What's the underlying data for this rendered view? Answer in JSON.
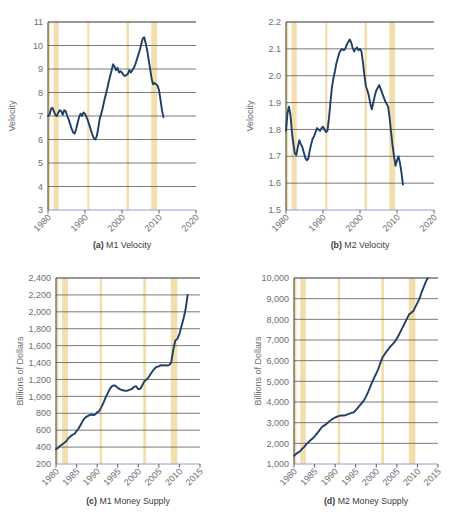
{
  "figure": {
    "background": "#ffffff",
    "series_color": "#1e3f66",
    "recession_band_color": "#f3dfae",
    "gridline_color": "#6b6b6b",
    "axis_color": "#4b4b4b",
    "baseline_color": "#9a9ad6"
  },
  "chart_data": [
    {
      "id": "a",
      "type": "line",
      "title": "M1 Velocity",
      "caption_prefix": "(a)",
      "xlabel": "",
      "ylabel": "Velocity",
      "xlim": [
        1980,
        2020
      ],
      "ylim": [
        3,
        11
      ],
      "ytick_step": 1,
      "xtick_step": 10,
      "grid": true,
      "legend": "none",
      "xticks": [
        "1980",
        "1990",
        "2000",
        "2010",
        "2020"
      ],
      "yticks": [
        "3",
        "4",
        "5",
        "6",
        "7",
        "8",
        "9",
        "10",
        "11"
      ],
      "recessions": [
        [
          1980.0,
          1980.6
        ],
        [
          1981.5,
          1982.9
        ],
        [
          1990.6,
          1991.2
        ],
        [
          2001.2,
          2001.9
        ],
        [
          2007.9,
          2009.5
        ]
      ],
      "x": [
        1980.0,
        1980.4,
        1980.8,
        1981.2,
        1981.6,
        1982.0,
        1982.4,
        1982.8,
        1983.2,
        1983.6,
        1984.0,
        1984.4,
        1984.8,
        1985.2,
        1985.6,
        1986.0,
        1986.4,
        1986.8,
        1987.2,
        1987.6,
        1988.0,
        1988.4,
        1988.8,
        1989.2,
        1989.6,
        1990.0,
        1990.4,
        1990.8,
        1991.2,
        1991.6,
        1992.0,
        1992.4,
        1992.8,
        1993.2,
        1993.6,
        1994.0,
        1994.4,
        1994.8,
        1995.2,
        1995.6,
        1996.0,
        1996.4,
        1996.8,
        1997.2,
        1997.6,
        1998.0,
        1998.4,
        1998.8,
        1999.2,
        1999.6,
        2000.0,
        2000.4,
        2000.8,
        2001.2,
        2001.6,
        2002.0,
        2002.4,
        2002.8,
        2003.2,
        2003.6,
        2004.0,
        2004.4,
        2004.8,
        2005.2,
        2005.6,
        2006.0,
        2006.4,
        2006.8,
        2007.2,
        2007.6,
        2008.0,
        2008.4,
        2008.8,
        2009.2,
        2009.6,
        2010.0,
        2010.4,
        2010.8,
        2011.2
      ],
      "y": [
        7.0,
        7.05,
        7.3,
        7.35,
        7.2,
        7.05,
        7.0,
        7.15,
        7.25,
        7.2,
        7.05,
        7.25,
        7.2,
        7.0,
        6.85,
        6.65,
        6.45,
        6.3,
        6.25,
        6.45,
        6.7,
        6.95,
        7.1,
        7.0,
        7.15,
        7.1,
        6.95,
        6.8,
        6.6,
        6.4,
        6.2,
        6.05,
        6.0,
        6.15,
        6.5,
        6.9,
        7.1,
        7.35,
        7.65,
        7.9,
        8.15,
        8.45,
        8.7,
        8.95,
        9.2,
        9.1,
        8.95,
        9.05,
        8.85,
        8.9,
        8.85,
        8.75,
        8.7,
        8.75,
        8.8,
        8.95,
        8.85,
        8.95,
        9.05,
        9.2,
        9.4,
        9.6,
        9.8,
        10.05,
        10.3,
        10.35,
        10.1,
        9.8,
        9.4,
        9.0,
        8.6,
        8.35,
        8.4,
        8.35,
        8.3,
        8.1,
        7.7,
        7.25,
        6.95
      ]
    },
    {
      "id": "b",
      "type": "line",
      "title": "M2 Velocity",
      "caption_prefix": "(b)",
      "xlabel": "",
      "ylabel": "Velocity",
      "xlim": [
        1980,
        2020
      ],
      "ylim": [
        1.5,
        2.2
      ],
      "ytick_step": 0.1,
      "xtick_step": 10,
      "grid": true,
      "legend": "none",
      "xticks": [
        "1980",
        "1990",
        "2000",
        "2010",
        "2020"
      ],
      "yticks": [
        "1.5",
        "1.6",
        "1.7",
        "1.8",
        "1.9",
        "2.0",
        "2.1",
        "2.2"
      ],
      "recessions": [
        [
          1980.0,
          1980.6
        ],
        [
          1981.5,
          1982.9
        ],
        [
          1990.6,
          1991.2
        ],
        [
          2001.2,
          2001.9
        ],
        [
          2007.9,
          2009.5
        ]
      ],
      "x": [
        1980.0,
        1980.4,
        1980.8,
        1981.2,
        1981.6,
        1982.0,
        1982.4,
        1982.8,
        1983.2,
        1983.6,
        1984.0,
        1984.4,
        1984.8,
        1985.2,
        1985.6,
        1986.0,
        1986.4,
        1986.8,
        1987.2,
        1987.6,
        1988.0,
        1988.4,
        1988.8,
        1989.2,
        1989.6,
        1990.0,
        1990.4,
        1990.8,
        1991.2,
        1991.6,
        1992.0,
        1992.4,
        1992.8,
        1993.2,
        1993.6,
        1994.0,
        1994.4,
        1994.8,
        1995.2,
        1995.6,
        1996.0,
        1996.4,
        1996.8,
        1997.2,
        1997.6,
        1998.0,
        1998.4,
        1998.8,
        1999.2,
        1999.6,
        2000.0,
        2000.4,
        2000.8,
        2001.2,
        2001.6,
        2002.0,
        2002.4,
        2002.8,
        2003.2,
        2003.6,
        2004.0,
        2004.4,
        2004.8,
        2005.2,
        2005.6,
        2006.0,
        2006.4,
        2006.8,
        2007.2,
        2007.6,
        2008.0,
        2008.4,
        2008.8,
        2009.2,
        2009.6,
        2010.0,
        2010.4,
        2010.8,
        2011.2,
        2011.6
      ],
      "y": [
        1.795,
        1.86,
        1.885,
        1.855,
        1.79,
        1.745,
        1.71,
        1.705,
        1.735,
        1.76,
        1.745,
        1.735,
        1.715,
        1.695,
        1.685,
        1.69,
        1.72,
        1.745,
        1.765,
        1.775,
        1.79,
        1.805,
        1.8,
        1.795,
        1.805,
        1.81,
        1.8,
        1.79,
        1.795,
        1.84,
        1.9,
        1.955,
        1.99,
        2.015,
        2.045,
        2.065,
        2.085,
        2.095,
        2.1,
        2.095,
        2.1,
        2.115,
        2.125,
        2.135,
        2.125,
        2.105,
        2.09,
        2.1,
        2.105,
        2.095,
        2.1,
        2.09,
        2.05,
        2.0,
        1.96,
        1.945,
        1.925,
        1.895,
        1.875,
        1.9,
        1.925,
        1.945,
        1.955,
        1.965,
        1.95,
        1.935,
        1.92,
        1.905,
        1.895,
        1.885,
        1.845,
        1.79,
        1.74,
        1.7,
        1.665,
        1.685,
        1.7,
        1.675,
        1.64,
        1.595
      ]
    },
    {
      "id": "c",
      "type": "line",
      "title": "M1 Money Supply",
      "caption_prefix": "(c)",
      "xlabel": "",
      "ylabel": "Billions of Dollars",
      "xlim": [
        1980,
        2015
      ],
      "ylim": [
        200,
        2400
      ],
      "ytick_step": 200,
      "xtick_step": 5,
      "grid": true,
      "legend": "none",
      "xticks": [
        "1980",
        "1985",
        "1990",
        "1995",
        "2000",
        "2005",
        "2010",
        "2015"
      ],
      "yticks": [
        "200",
        "400",
        "600",
        "800",
        "1,000",
        "1,200",
        "1,400",
        "1,600",
        "1,800",
        "2,000",
        "2,200",
        "2,400"
      ],
      "recessions": [
        [
          1980.0,
          1980.6
        ],
        [
          1981.5,
          1982.9
        ],
        [
          1990.6,
          1991.2
        ],
        [
          2001.2,
          2001.9
        ],
        [
          2007.9,
          2009.5
        ]
      ],
      "x": [
        1980.0,
        1980.5,
        1981.0,
        1981.5,
        1982.0,
        1982.5,
        1983.0,
        1983.5,
        1984.0,
        1984.5,
        1985.0,
        1985.5,
        1986.0,
        1986.5,
        1987.0,
        1987.5,
        1988.0,
        1988.5,
        1989.0,
        1989.5,
        1990.0,
        1990.5,
        1991.0,
        1991.5,
        1992.0,
        1992.5,
        1993.0,
        1993.5,
        1994.0,
        1994.5,
        1995.0,
        1995.5,
        1996.0,
        1996.5,
        1997.0,
        1997.5,
        1998.0,
        1998.5,
        1999.0,
        1999.5,
        2000.0,
        2000.5,
        2001.0,
        2001.5,
        2002.0,
        2002.5,
        2003.0,
        2003.5,
        2004.0,
        2004.5,
        2005.0,
        2005.5,
        2006.0,
        2006.5,
        2007.0,
        2007.5,
        2008.0,
        2008.5,
        2009.0,
        2009.5,
        2010.0,
        2010.5,
        2011.0,
        2011.5,
        2012.0
      ],
      "y": [
        375,
        390,
        415,
        430,
        450,
        470,
        505,
        525,
        545,
        555,
        590,
        620,
        665,
        710,
        745,
        760,
        775,
        785,
        780,
        785,
        810,
        825,
        870,
        920,
        980,
        1030,
        1080,
        1115,
        1130,
        1125,
        1100,
        1085,
        1075,
        1070,
        1065,
        1070,
        1080,
        1090,
        1115,
        1120,
        1085,
        1090,
        1135,
        1180,
        1200,
        1225,
        1265,
        1300,
        1330,
        1350,
        1355,
        1370,
        1365,
        1370,
        1365,
        1370,
        1400,
        1550,
        1660,
        1680,
        1740,
        1830,
        1920,
        2030,
        2200
      ]
    },
    {
      "id": "d",
      "type": "line",
      "title": "M2 Money Supply",
      "caption_prefix": "(d)",
      "xlabel": "",
      "ylabel": "Billions of Dollars",
      "xlim": [
        1980,
        2015
      ],
      "ylim": [
        1000,
        10000
      ],
      "ytick_step": 1000,
      "xtick_step": 5,
      "grid": true,
      "legend": "none",
      "xticks": [
        "1980",
        "1985",
        "1990",
        "1995",
        "2000",
        "2005",
        "2010",
        "2015"
      ],
      "yticks": [
        "1,000",
        "2,000",
        "3,000",
        "4,000",
        "5,000",
        "6,000",
        "7,000",
        "8,000",
        "9,000",
        "10,000"
      ],
      "recessions": [
        [
          1980.0,
          1980.6
        ],
        [
          1981.5,
          1982.9
        ],
        [
          1990.6,
          1991.2
        ],
        [
          2001.2,
          2001.9
        ],
        [
          2007.9,
          2009.5
        ]
      ],
      "x": [
        1980.0,
        1980.5,
        1981.0,
        1981.5,
        1982.0,
        1982.5,
        1983.0,
        1983.5,
        1984.0,
        1984.5,
        1985.0,
        1985.5,
        1986.0,
        1986.5,
        1987.0,
        1987.5,
        1988.0,
        1988.5,
        1989.0,
        1989.5,
        1990.0,
        1990.5,
        1991.0,
        1991.5,
        1992.0,
        1992.5,
        1993.0,
        1993.5,
        1994.0,
        1994.5,
        1995.0,
        1995.5,
        1996.0,
        1996.5,
        1997.0,
        1997.5,
        1998.0,
        1998.5,
        1999.0,
        1999.5,
        2000.0,
        2000.5,
        2001.0,
        2001.5,
        2002.0,
        2002.5,
        2003.0,
        2003.5,
        2004.0,
        2004.5,
        2005.0,
        2005.5,
        2006.0,
        2006.5,
        2007.0,
        2007.5,
        2008.0,
        2008.5,
        2009.0,
        2009.5,
        2010.0,
        2010.5,
        2011.0,
        2011.5,
        2012.0,
        2012.5
      ],
      "y": [
        1400,
        1480,
        1560,
        1620,
        1740,
        1830,
        1960,
        2050,
        2150,
        2230,
        2340,
        2460,
        2580,
        2720,
        2820,
        2880,
        2960,
        3050,
        3130,
        3200,
        3250,
        3290,
        3330,
        3350,
        3350,
        3360,
        3400,
        3440,
        3470,
        3500,
        3600,
        3720,
        3840,
        3960,
        4080,
        4260,
        4480,
        4720,
        4960,
        5180,
        5380,
        5600,
        5900,
        6150,
        6300,
        6450,
        6570,
        6700,
        6800,
        6920,
        7070,
        7250,
        7450,
        7650,
        7850,
        8050,
        8250,
        8320,
        8400,
        8600,
        8800,
        9000,
        9300,
        9550,
        9800,
        10000
      ]
    }
  ]
}
